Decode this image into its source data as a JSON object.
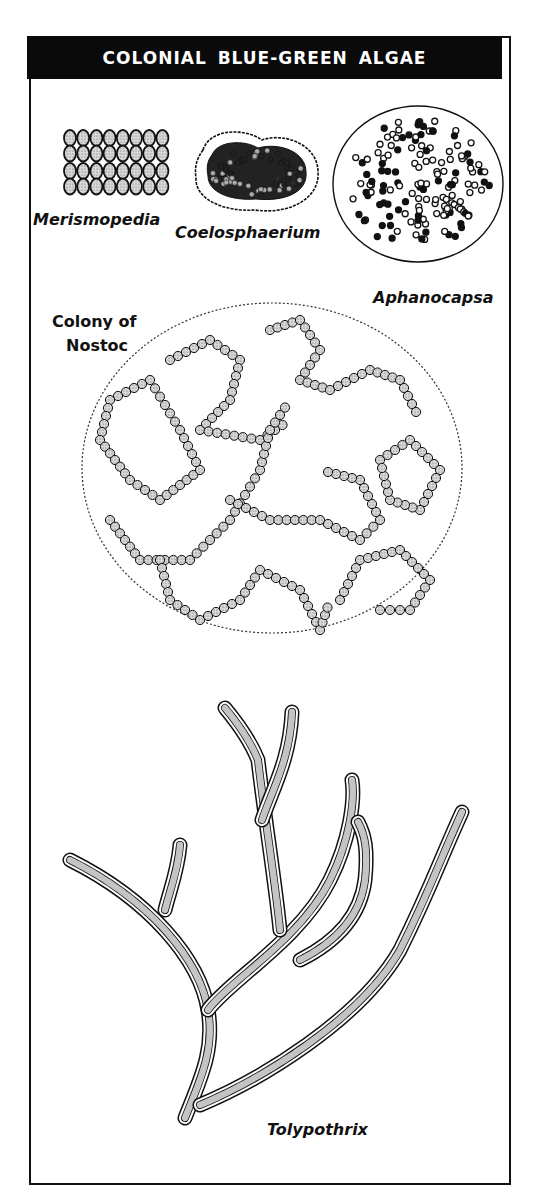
{
  "page": {
    "title": "COLONIAL BLUE-GREEN ALGAE",
    "colors": {
      "header_bg": "#0a0a0a",
      "header_text": "#ffffff",
      "ink": "#111111",
      "paper": "#ffffff",
      "cell_fill": "#bdbdbd"
    }
  },
  "specimens": [
    {
      "id": "merismopedia",
      "label": "Merismopedia",
      "italic": true,
      "form": "flat rectangular plate of cells, 8 columns x 4 rows"
    },
    {
      "id": "coelosphaerium",
      "label": "Coelosphaerium",
      "italic": true,
      "form": "hollow oval colony with cells near surface in gelatinous sheath"
    },
    {
      "id": "aphanocapsa",
      "label": "Aphanocapsa",
      "italic": true,
      "form": "round colony with scattered cells"
    },
    {
      "id": "nostoc",
      "label_line1": "Colony of",
      "label_line2": "Nostoc",
      "italic_line2": true,
      "form": "bead-like filaments coiled in a round gelatinous mass"
    },
    {
      "id": "tolypothrix",
      "label": "Tolypothrix",
      "italic": true,
      "form": "branched sheathed filaments"
    }
  ]
}
